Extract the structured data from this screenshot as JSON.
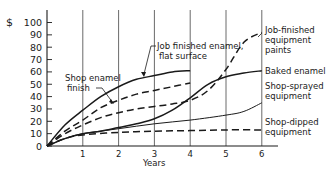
{
  "chart_data": {
    "type": "line",
    "title": "",
    "xlabel": "Years",
    "ylabel": "$",
    "y_prefix": "$",
    "xlim": [
      0,
      6
    ],
    "ylim": [
      0,
      100
    ],
    "x_ticks": [
      1,
      2,
      3,
      4,
      5,
      6
    ],
    "y_ticks": [
      0,
      10,
      20,
      30,
      40,
      50,
      60,
      70,
      80,
      90,
      100
    ],
    "grid": {
      "vertical": true,
      "horizontal": false
    },
    "legend": "direct labels",
    "series": [
      {
        "name": "Job finished enamel, flat surface",
        "style": "solid",
        "width": 1.5,
        "x": [
          0,
          0.5,
          1,
          1.5,
          2,
          2.5,
          3,
          3.5,
          4
        ],
        "values": [
          0,
          17,
          29,
          40,
          48,
          54,
          57,
          60,
          61
        ]
      },
      {
        "name": "Shop enamel finish",
        "style": "dashed",
        "width": 1.5,
        "x": [
          0,
          0.5,
          1,
          1.5,
          2,
          2.5,
          3,
          3.5,
          4
        ],
        "values": [
          0,
          12,
          21,
          31,
          37,
          42,
          45,
          48,
          51
        ]
      },
      {
        "name": "Job-finished equipment paints",
        "style": "dashed",
        "width": 1.5,
        "x": [
          0,
          0.5,
          1,
          1.5,
          2,
          2.5,
          3,
          3.5,
          4,
          4.5,
          5,
          5.5,
          6
        ],
        "values": [
          0,
          10,
          17,
          23,
          27,
          30,
          32,
          34,
          37,
          45,
          62,
          84,
          92
        ]
      },
      {
        "name": "Baked enamel",
        "style": "solid",
        "width": 1.5,
        "x": [
          0,
          0.5,
          1,
          1.5,
          2,
          2.5,
          3,
          3.5,
          4,
          4.5,
          5,
          5.5,
          6
        ],
        "values": [
          0,
          6,
          10,
          12,
          15,
          18,
          22,
          29,
          39,
          50,
          56,
          59,
          61
        ]
      },
      {
        "name": "Shop-sprayed equipment",
        "style": "solid",
        "width": 1,
        "x": [
          0,
          0.5,
          1,
          2,
          3,
          4,
          5,
          5.5,
          6
        ],
        "values": [
          0,
          6,
          10,
          14,
          18,
          21,
          25,
          28,
          35
        ]
      },
      {
        "name": "Shop-dipped equipment",
        "style": "dashed",
        "width": 1.5,
        "x": [
          0,
          0.5,
          1,
          2,
          3,
          4,
          5,
          6
        ],
        "values": [
          0,
          6,
          9,
          11,
          12,
          12.5,
          13,
          13
        ]
      }
    ],
    "annotations": [
      {
        "text": [
          "Shop enamel",
          "finish"
        ],
        "points_to": "Shop enamel finish",
        "at_x": 1.9
      },
      {
        "text": [
          "Job finished enamel,",
          "flat surface"
        ],
        "points_to": "Job finished enamel, flat surface",
        "at_x": 2.3
      },
      {
        "text": [
          "Job-finished",
          "equipment",
          "paints"
        ],
        "points_to": "Job-finished equipment paints",
        "at_x": 6
      },
      {
        "text": [
          "Baked enamel"
        ],
        "points_to": "Baked enamel",
        "at_x": 6
      },
      {
        "text": [
          "Shop-sprayed",
          "equipment"
        ],
        "points_to": "Shop-sprayed equipment",
        "at_x": 6
      },
      {
        "text": [
          "Shop-dipped",
          "equipment"
        ],
        "points_to": "Shop-dipped equipment",
        "at_x": 6
      }
    ]
  },
  "labels": {
    "y_currency": "$",
    "x_axis": "Years",
    "shop_enamel_1": "Shop enamel",
    "shop_enamel_2": "finish",
    "job_flat_1": "Job finished enamel,",
    "job_flat_2": "flat surface",
    "job_paint_1": "Job-finished",
    "job_paint_2": "equipment",
    "job_paint_3": "paints",
    "baked": "Baked enamel",
    "sprayed_1": "Shop-sprayed",
    "sprayed_2": "equipment",
    "dipped_1": "Shop-dipped",
    "dipped_2": "equipment"
  }
}
